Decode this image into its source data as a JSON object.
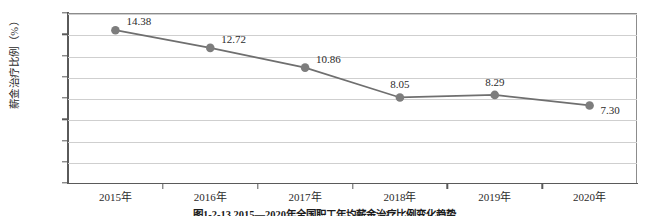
{
  "chart_data": {
    "type": "line",
    "title": "",
    "xlabel": "",
    "ylabel": "薪金治疗比例（%）",
    "categories": [
      "2015年",
      "2016年",
      "2017年",
      "2018年",
      "2019年",
      "2020年"
    ],
    "values": [
      14.38,
      12.72,
      10.86,
      8.05,
      8.29,
      7.3
    ],
    "point_labels": [
      "14.38",
      "12.72",
      "10.86",
      "8.05",
      "8.29",
      "7.30"
    ],
    "series": [
      {
        "name": "薪金治疗比例",
        "values": [
          14.38,
          12.72,
          10.86,
          8.05,
          8.29,
          7.3
        ]
      }
    ],
    "ylim": [
      0,
      16
    ],
    "ytick_labels": [
      "16.00",
      "14.00",
      "12.00",
      "10.00",
      "8.00",
      "6.00",
      "4.00",
      "2.00",
      "0"
    ],
    "ytick_values": [
      16,
      14,
      12,
      10,
      8,
      6,
      4,
      2,
      0
    ],
    "grid": true,
    "legend": "none",
    "colors": {
      "line": "#6f6f6f",
      "marker": "#7d7d7d",
      "gridline": "#cfcfcf",
      "axis": "#5a5a5a",
      "text": "#2b2b2b"
    }
  },
  "caption": {
    "text": "图1-2-13  2015—2020年全国职工年均薪金治疗比例变化趋势"
  }
}
